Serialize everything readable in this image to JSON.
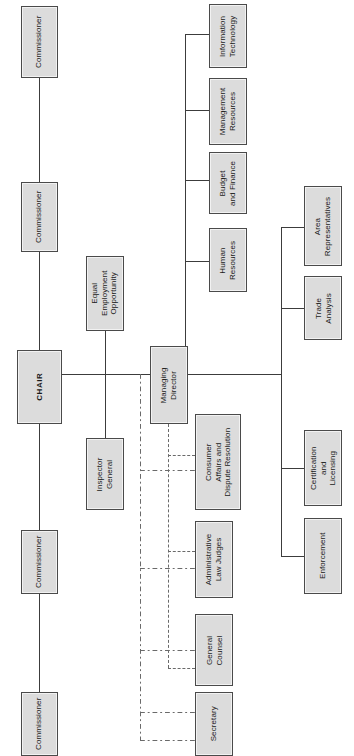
{
  "chart": {
    "orientation": "rotated-90-ccw",
    "type": "organizational-chart",
    "colors": {
      "node_fill": "#dcdcdc",
      "node_border": "#4a4a4a",
      "line": "#3c3c3c",
      "dashed_line": "#6a6a6a",
      "background": "#ffffff"
    },
    "caption": ""
  },
  "nodes": {
    "commissioner_1": {
      "label": "Commissioner"
    },
    "commissioner_2": {
      "label": "Commissioner"
    },
    "chair": {
      "label": "CHAIR"
    },
    "commissioner_3": {
      "label": "Commissioner"
    },
    "commissioner_4": {
      "label": "Commissioner"
    },
    "eeo": {
      "line1": "Equal",
      "line2": "Employment",
      "line3": "Opportunity"
    },
    "inspector_general": {
      "line1": "Inspector",
      "line2": "General"
    },
    "managing_director": {
      "line1": "Managing",
      "line2": "Director"
    },
    "information_technology": {
      "line1": "Information",
      "line2": "Technology"
    },
    "management_resources": {
      "line1": "Management",
      "line2": "Resources"
    },
    "budget_and_finance": {
      "line1": "Budget",
      "line2": "and Finance"
    },
    "human_resources": {
      "line1": "Human",
      "line2": "Resources"
    },
    "area_representatives": {
      "line1": "Area",
      "line2": "Representatives"
    },
    "trade_analysis": {
      "line1": "Trade",
      "line2": "Analysis"
    },
    "certification_licensing": {
      "line1": "Certification",
      "line2": "and",
      "line3": "Licensing"
    },
    "enforcement": {
      "line1": "Enforcement"
    },
    "consumer_affairs": {
      "line1": "Consumer",
      "line2": "Affairs and",
      "line3": "Dispute Resolution"
    },
    "admin_law_judges": {
      "line1": "Administrative",
      "line2": "Law Judges"
    },
    "general_counsel": {
      "line1": "General",
      "line2": "Counsel"
    },
    "secretary": {
      "line1": "Secretary"
    }
  },
  "relations": {
    "commission_spine": [
      "Commissioner",
      "Commissioner",
      "CHAIR",
      "Commissioner",
      "Commissioner"
    ],
    "chair_reports": [
      "Equal Employment Opportunity",
      "Inspector General",
      "Managing Director"
    ],
    "managing_director_reports": [
      "Human Resources",
      "Budget and Finance",
      "Management Resources",
      "Information Technology",
      "Area Representatives",
      "Trade Analysis",
      "Certification and Licensing",
      "Enforcement"
    ],
    "dashed_reports": [
      "Consumer Affairs and Dispute Resolution",
      "Administrative Law Judges",
      "General Counsel",
      "Secretary"
    ]
  }
}
